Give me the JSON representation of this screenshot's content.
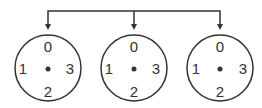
{
  "diagram": {
    "connector": {
      "color": "#333333"
    },
    "dials": [
      {
        "top": "0",
        "left": "1",
        "right": "3",
        "bottom": "2"
      },
      {
        "top": "0",
        "left": "1",
        "right": "3",
        "bottom": "2"
      },
      {
        "top": "0",
        "left": "1",
        "right": "3",
        "bottom": "2"
      }
    ]
  }
}
